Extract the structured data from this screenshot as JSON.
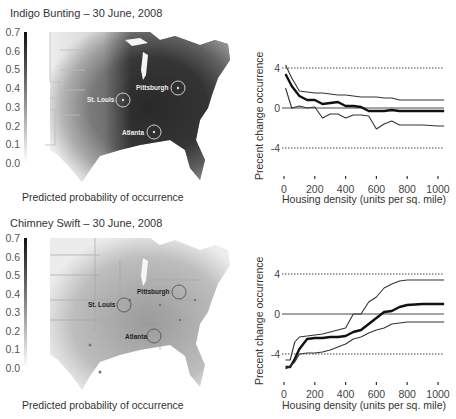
{
  "panels": [
    {
      "title": "Indigo Bunting – 30 June, 2008",
      "colorbar": {
        "ticks": [
          "0.7",
          "0.6",
          "0.5",
          "0.4",
          "0.3",
          "0.2",
          "0.1",
          "0.0"
        ],
        "caption": "Predicted probability of occurrence"
      },
      "cities": [
        "St. Louis",
        "Pittsburgh",
        "Atlanta"
      ]
    },
    {
      "title": "Chimney Swift – 30 June, 2008",
      "colorbar": {
        "ticks": [
          "0.7",
          "0.6",
          "0.5",
          "0.4",
          "0.3",
          "0.2",
          "0.1",
          "0.0"
        ],
        "caption": "Predicted probability of occurrence"
      },
      "cities": [
        "St. Louis",
        "Pittsburgh",
        "Atlanta"
      ]
    }
  ],
  "chart_data": [
    {
      "type": "line",
      "title": "Indigo Bunting",
      "xlabel": "Housing density (units per sq. mile)",
      "ylabel": "Precent change occurrence",
      "xticks": [
        "0",
        "200",
        "400",
        "600",
        "800",
        "1000"
      ],
      "yticks": [
        "4",
        "0",
        "-4"
      ],
      "xlim": [
        0,
        1050
      ],
      "ylim": [
        -6,
        5
      ],
      "reference_lines": [
        {
          "y": 4,
          "style": "dotted"
        },
        {
          "y": 0,
          "style": "solid"
        },
        {
          "y": -4,
          "style": "dotted"
        }
      ],
      "x": [
        10,
        50,
        100,
        150,
        200,
        250,
        300,
        350,
        400,
        450,
        500,
        550,
        600,
        650,
        700,
        750,
        800,
        900,
        1000,
        1040
      ],
      "series": [
        {
          "name": "upper",
          "values": [
            4.3,
            3.0,
            1.7,
            1.6,
            1.5,
            1.5,
            1.4,
            1.3,
            1.3,
            1.2,
            1.1,
            1.1,
            1.1,
            1.0,
            1.0,
            0.8,
            0.8,
            0.8,
            0.8,
            0.8
          ]
        },
        {
          "name": "mean",
          "values": [
            3.4,
            2.2,
            1.2,
            0.8,
            0.8,
            0.4,
            0.5,
            0.6,
            0.2,
            0.2,
            0.1,
            -0.3,
            -0.3,
            -0.3,
            -0.2,
            -0.3,
            -0.3,
            -0.3,
            -0.3,
            -0.3
          ]
        },
        {
          "name": "lower",
          "values": [
            2.0,
            0.0,
            0.2,
            0.0,
            0.1,
            -1.0,
            -0.6,
            -0.6,
            -1.0,
            -0.7,
            -0.7,
            -0.8,
            -2.1,
            -1.6,
            -1.3,
            -1.7,
            -1.7,
            -1.7,
            -1.8,
            -1.8
          ]
        }
      ]
    },
    {
      "type": "line",
      "title": "Chimney Swift",
      "xlabel": "Housing density (units per sq. mile)",
      "ylabel": "Precent change occurrence",
      "xticks": [
        "0",
        "200",
        "400",
        "600",
        "800",
        "1000"
      ],
      "yticks": [
        "4",
        "0",
        "-4"
      ],
      "xlim": [
        0,
        1050
      ],
      "ylim": [
        -6,
        5
      ],
      "reference_lines": [
        {
          "y": 4,
          "style": "dotted"
        },
        {
          "y": 0,
          "style": "solid"
        },
        {
          "y": -4,
          "style": "dotted"
        }
      ],
      "x": [
        10,
        40,
        70,
        100,
        150,
        200,
        250,
        300,
        350,
        400,
        450,
        500,
        550,
        600,
        650,
        700,
        750,
        800,
        900,
        1000,
        1040
      ],
      "series": [
        {
          "name": "upper",
          "values": [
            -4.6,
            -4.6,
            -2.8,
            -2.3,
            -2.2,
            -2.1,
            -2.0,
            -1.8,
            -1.6,
            -1.4,
            0.0,
            0.0,
            1.2,
            1.7,
            2.6,
            3.0,
            3.3,
            3.4,
            3.4,
            3.4,
            3.4
          ]
        },
        {
          "name": "mean",
          "values": [
            -5.3,
            -5.3,
            -4.5,
            -3.5,
            -2.5,
            -2.4,
            -2.4,
            -2.3,
            -2.3,
            -2.2,
            -1.8,
            -1.6,
            -1.0,
            -0.4,
            0.2,
            0.3,
            0.7,
            0.9,
            1.0,
            1.0,
            1.0
          ]
        },
        {
          "name": "lower",
          "values": [
            -5.5,
            -5.2,
            -4.8,
            -4.0,
            -3.9,
            -3.9,
            -3.8,
            -3.6,
            -3.3,
            -3.0,
            -2.5,
            -2.3,
            -1.9,
            -1.6,
            -1.4,
            -1.0,
            -0.9,
            -0.8,
            -0.8,
            -0.8,
            -0.8
          ]
        }
      ]
    }
  ]
}
